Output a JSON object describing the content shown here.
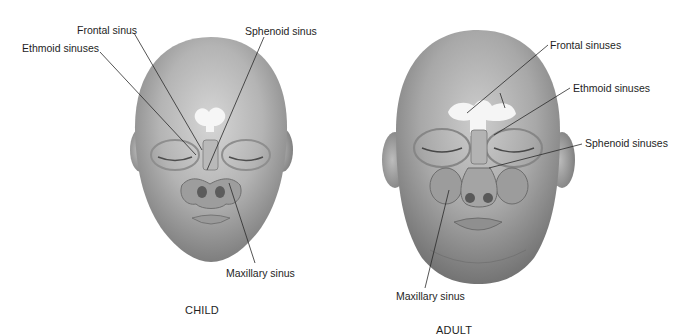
{
  "figure": {
    "panels": [
      {
        "id": "child",
        "caption": "CHILD",
        "labels": {
          "frontal": "Frontal sinus",
          "ethmoid": "Ethmoid sinuses",
          "sphenoid": "Sphenoid sinus",
          "maxillary": "Maxillary sinus"
        }
      },
      {
        "id": "adult",
        "caption": "ADULT",
        "labels": {
          "frontal": "Frontal sinuses",
          "ethmoid": "Ethmoid sinuses",
          "sphenoid": "Sphenoid sinuses",
          "maxillary": "Maxillary sinus"
        }
      }
    ],
    "colors": {
      "background": "#ffffff",
      "skin_light": "#cfcfcf",
      "skin_mid": "#a9a9a9",
      "skin_dark": "#7d7d7d",
      "sinus_highlight": "#f4f4f4",
      "leader_line": "#2a2a2a",
      "text": "#1e1e1e"
    }
  }
}
